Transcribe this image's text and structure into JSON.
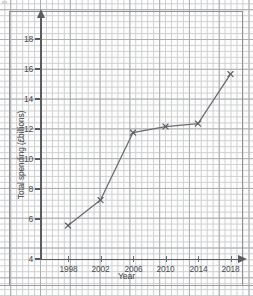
{
  "chart_data": {
    "type": "line",
    "title": "",
    "xlabel": "Year",
    "ylabel": "Total spending (£billions)",
    "x": [
      1998,
      2002,
      2006,
      2010,
      2014,
      2018
    ],
    "values": [
      6.2,
      7.9,
      12.4,
      12.8,
      13.0,
      16.3
    ],
    "series": [
      {
        "name": "Total spending",
        "values": [
          6.2,
          7.9,
          12.4,
          12.8,
          13.0,
          16.3
        ]
      }
    ],
    "xtick_labels": [
      "1998",
      "2002",
      "2006",
      "2010",
      "2014",
      "2018"
    ],
    "ytick_labels": [
      "4",
      "6",
      "8",
      "10",
      "12",
      "14",
      "16",
      "18"
    ],
    "xlim": [
      1996,
      2020
    ],
    "ylim": [
      4,
      19
    ],
    "grid": true,
    "grid_type": "graph-paper",
    "legend": "none",
    "marker": "cross",
    "line_color": "#6a6b70",
    "grid_major_color": "#a9aab0",
    "grid_minor_color": "#cdced3",
    "axis_color": "#5b5c61"
  },
  "axes": {
    "y_title": "Total spending (£billions)",
    "x_title": "Year",
    "y_ticks": [
      {
        "label": "18",
        "value": 18
      },
      {
        "label": "16",
        "value": 16
      },
      {
        "label": "14",
        "value": 14
      },
      {
        "label": "12",
        "value": 12
      },
      {
        "label": "10",
        "value": 10
      },
      {
        "label": "8",
        "value": 8
      },
      {
        "label": "6",
        "value": 6
      },
      {
        "label": "4",
        "value": 4
      }
    ],
    "x_ticks": [
      {
        "label": "1998",
        "value": 1998
      },
      {
        "label": "2002",
        "value": 2002
      },
      {
        "label": "2006",
        "value": 2006
      },
      {
        "label": "2010",
        "value": 2010
      },
      {
        "label": "2014",
        "value": 2014
      },
      {
        "label": "2018",
        "value": 2018
      }
    ]
  }
}
